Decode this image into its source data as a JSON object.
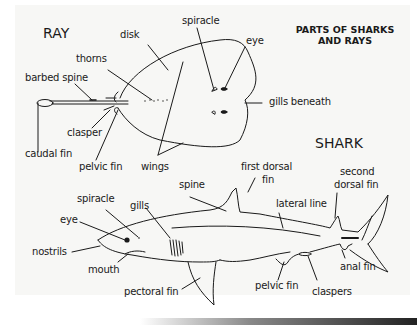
{
  "title": {
    "line1": "PARTS OF SHARKS",
    "line2": "AND RAYS"
  },
  "ray": {
    "heading": "RAY",
    "labels": {
      "disk": "disk",
      "spiracle": "spiracle",
      "eye": "eye",
      "thorns": "thorns",
      "barbed_spine": "barbed spine",
      "gills_beneath": "gills beneath",
      "clasper": "clasper",
      "caudal_fin": "caudal fin",
      "pelvic_fin": "pelvic fin",
      "wings": "wings"
    }
  },
  "shark": {
    "heading": "SHARK",
    "labels": {
      "spine": "spine",
      "first_dorsal_fin_1": "first dorsal",
      "first_dorsal_fin_2": "fin",
      "second_dorsal_fin_1": "second",
      "second_dorsal_fin_2": "dorsal fin",
      "spiracle": "spiracle",
      "gills": "gills",
      "lateral_line": "lateral line",
      "eye": "eye",
      "nostrils": "nostrils",
      "mouth": "mouth",
      "anal_fin": "anal fin",
      "pectoral_fin": "pectoral fin",
      "pelvic_fin": "pelvic fin",
      "claspers": "claspers"
    }
  },
  "colors": {
    "ink": "#1a1a1a",
    "paper": "#f7f7f5"
  }
}
